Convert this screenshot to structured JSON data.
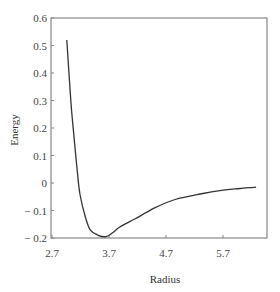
{
  "chart_data": {
    "type": "line",
    "title": "",
    "xlabel": "Radius",
    "ylabel": "Energy",
    "xlim": [
      2.7,
      6.5
    ],
    "ylim": [
      -0.2,
      0.6
    ],
    "x_ticks": [
      "2.7",
      "3.7",
      "4.7",
      "5.7"
    ],
    "x_tick_values": [
      2.7,
      3.7,
      4.7,
      5.7
    ],
    "y_ticks": [
      "0.6",
      "0.5",
      "0.4",
      "0.3",
      "0.2",
      "0.1",
      "0",
      "− 0.1",
      "− 0.2"
    ],
    "y_tick_values": [
      0.6,
      0.5,
      0.4,
      0.3,
      0.2,
      0.1,
      0,
      -0.1,
      -0.2
    ],
    "grid": false,
    "legend": null,
    "series": [
      {
        "name": "Energy",
        "color": "#333333",
        "x": [
          2.96,
          3.03,
          3.09,
          3.14,
          3.19,
          3.28,
          3.37,
          3.51,
          3.65,
          3.77,
          3.89,
          4.16,
          4.51,
          4.86,
          5.3,
          5.74,
          6.0,
          6.28
        ],
        "y": [
          0.52,
          0.3,
          0.16,
          0.05,
          -0.04,
          -0.12,
          -0.17,
          -0.19,
          -0.195,
          -0.18,
          -0.16,
          -0.13,
          -0.09,
          -0.06,
          -0.04,
          -0.025,
          -0.02,
          -0.015
        ]
      }
    ]
  }
}
